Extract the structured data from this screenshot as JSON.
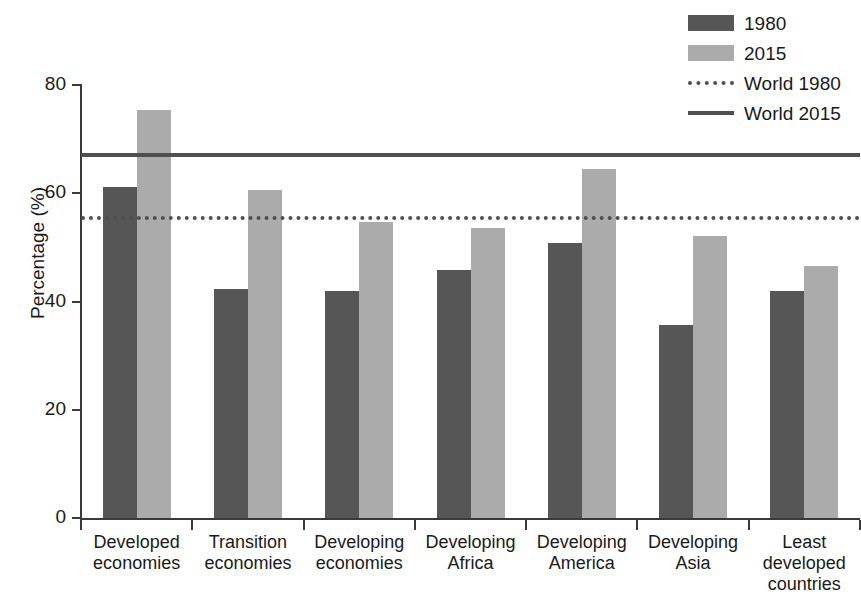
{
  "chart_data": {
    "type": "bar",
    "title": "",
    "xlabel": "",
    "ylabel": "Percentage (%)",
    "ylim": [
      0,
      80
    ],
    "yticks": [
      0,
      20,
      40,
      60,
      80
    ],
    "grid": false,
    "legend_position": "top-right",
    "categories": [
      "Developed economies",
      "Transition economies",
      "Developing economies",
      "Developing Africa",
      "Developing America",
      "Developing Asia",
      "Least developed countries"
    ],
    "category_lines": [
      [
        "Developed",
        "economies"
      ],
      [
        "Transition",
        "economies"
      ],
      [
        "Developing",
        "economies"
      ],
      [
        "Developing",
        "Africa"
      ],
      [
        "Developing",
        "America"
      ],
      [
        "Developing",
        "Asia"
      ],
      [
        "Least",
        "developed",
        "countries"
      ]
    ],
    "series": [
      {
        "name": "1980",
        "color": "#565656",
        "values": [
          61.2,
          42.3,
          42.0,
          45.8,
          50.8,
          35.6,
          42.0
        ]
      },
      {
        "name": "2015",
        "color": "#ababab",
        "values": [
          75.3,
          60.6,
          54.7,
          53.6,
          64.4,
          52.1,
          46.6
        ]
      }
    ],
    "reference_lines": [
      {
        "name": "World 1980",
        "value": 55.5,
        "style": "dotted",
        "color": "#4f4f4f"
      },
      {
        "name": "World 2015",
        "value": 67.0,
        "style": "solid",
        "color": "#4f4f4f"
      }
    ]
  },
  "legend": {
    "items": [
      {
        "label": "1980",
        "key": "swatch-dark"
      },
      {
        "label": "2015",
        "key": "swatch-light"
      },
      {
        "label": "World 1980",
        "key": "line-dotted"
      },
      {
        "label": "World 2015",
        "key": "line-solid"
      }
    ]
  }
}
